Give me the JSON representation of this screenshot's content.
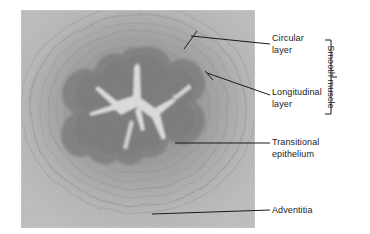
{
  "figure": {
    "image": {
      "name": "ureter-cross-section-micrograph",
      "description": "Light micrograph of a ureter in transverse section showing star-shaped lumen lined by transitional epithelium, surrounded by smooth muscle layers and adventitia",
      "stain_tone": "grayscale",
      "colors": {
        "background_outer": "#b4b4b4",
        "adventitia": "#b9b9b9",
        "longitudinal_layer": "#a8a8a8",
        "circular_layer": "#9a9a9a",
        "epithelium_dark": "#808080",
        "lumen_bright": "#d8d8d8",
        "page_background": "#ffffff"
      }
    }
  },
  "labels": [
    {
      "id": "circular-layer",
      "lines": [
        "Circular",
        "layer"
      ],
      "leader": "diagonal-up-left"
    },
    {
      "id": "longitudinal-layer",
      "lines": [
        "Longitudinal",
        "layer"
      ],
      "leader": "diagonal-up-left"
    },
    {
      "id": "transitional-epithelium",
      "lines": [
        "Transitional",
        "epithelium"
      ],
      "leader": "horizontal-left"
    },
    {
      "id": "adventitia",
      "lines": [
        "Adventitia"
      ],
      "leader": "horizontal-left"
    }
  ],
  "bracket": {
    "label": "Smooth muscle",
    "groups": [
      "Circular layer",
      "Longitudinal layer"
    ],
    "color": "#1a1a1a"
  }
}
